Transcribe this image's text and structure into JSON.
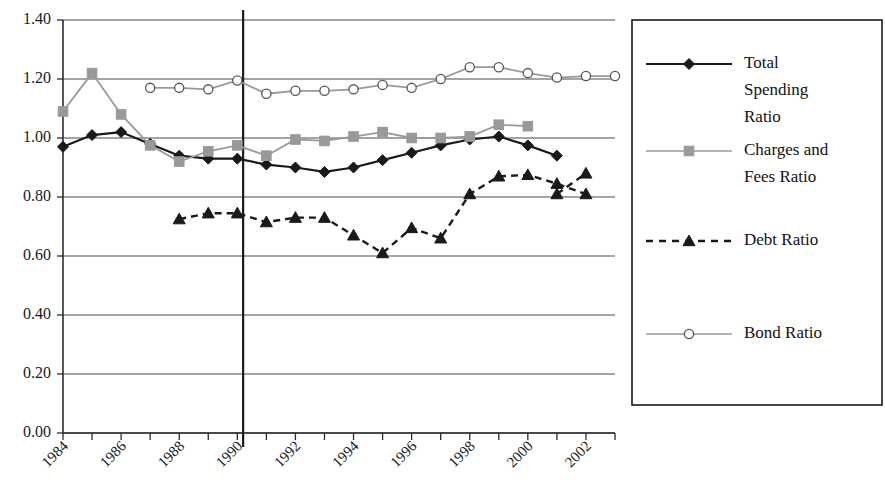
{
  "chart_data": {
    "type": "line",
    "title": "",
    "subtitle": "",
    "xlabel": "",
    "ylabel": "",
    "xlim": [
      1984,
      2003
    ],
    "ylim": [
      0.0,
      1.4
    ],
    "yticks": [
      "0.00",
      "0.20",
      "0.40",
      "0.60",
      "0.80",
      "1.00",
      "1.20",
      "1.40"
    ],
    "ytick_values": [
      0.0,
      0.2,
      0.4,
      0.6,
      0.8,
      1.0,
      1.2,
      1.4
    ],
    "xticks": [
      "1984",
      "1986",
      "1988",
      "1990",
      "1992",
      "1994",
      "1996",
      "1998",
      "2000",
      "2002"
    ],
    "xtick_values": [
      1984,
      1986,
      1988,
      1990,
      1992,
      1994,
      1996,
      1998,
      2000,
      2002
    ],
    "xtick_rotation": 45,
    "xtick_minor_values": [
      1985,
      1987,
      1989,
      1991,
      1993,
      1995,
      1997,
      1999,
      2001,
      2003
    ],
    "grid": "horizontal",
    "legend_position": "right",
    "annotations": [
      {
        "name": "vertical-reference-line",
        "type": "vline",
        "x": 1990.2,
        "color": "#1a1a1a"
      }
    ],
    "series": [
      {
        "name": "Total Spending Ratio",
        "color": "#1a1a1a",
        "line_style": "solid",
        "marker": "diamond-filled",
        "x": [
          1984,
          1985,
          1986,
          1987,
          1988,
          1989,
          1990,
          1991,
          1992,
          1993,
          1994,
          1995,
          1996,
          1997,
          1998,
          1999,
          2000,
          2001
        ],
        "values": [
          0.97,
          1.01,
          1.02,
          0.98,
          0.94,
          0.93,
          0.93,
          0.91,
          0.9,
          0.885,
          0.9,
          0.925,
          0.95,
          0.975,
          0.995,
          1.005,
          0.975,
          0.94
        ]
      },
      {
        "name": "Charges and Fees Ratio",
        "color": "#999999",
        "line_style": "solid",
        "marker": "square-filled",
        "x": [
          1984,
          1985,
          1986,
          1987,
          1988,
          1989,
          1990,
          1991,
          1992,
          1993,
          1994,
          1995,
          1996,
          1997,
          1998,
          1999,
          2000
        ],
        "values": [
          1.09,
          1.22,
          1.08,
          0.975,
          0.92,
          0.955,
          0.975,
          0.94,
          0.995,
          0.99,
          1.005,
          1.02,
          1.0,
          1.0,
          1.005,
          1.045,
          1.04
        ]
      },
      {
        "name": "Debt Ratio",
        "color": "#1a1a1a",
        "line_style": "dashed",
        "marker": "triangle-filled",
        "x": [
          1988,
          1989,
          1990,
          1991,
          1992,
          1993,
          1994,
          1995,
          1996,
          1997,
          1998,
          1999,
          2000,
          2001,
          2002
        ],
        "values": [
          0.725,
          0.745,
          0.745,
          0.715,
          0.73,
          0.73,
          0.67,
          0.61,
          0.695,
          0.66,
          0.81,
          0.87,
          0.875,
          0.845,
          0.81
        ]
      },
      {
        "name": "Debt Ratio Tail",
        "color": "#1a1a1a",
        "line_style": "dashed",
        "marker": "triangle-filled",
        "x": [
          2001,
          2002
        ],
        "values": [
          0.81,
          0.88
        ],
        "hidden_from_legend": true
      },
      {
        "name": "Bond Ratio",
        "color": "#999999",
        "line_style": "solid",
        "marker": "circle-open",
        "x": [
          1987,
          1988,
          1989,
          1990,
          1991,
          1992,
          1993,
          1994,
          1995,
          1996,
          1997,
          1998,
          1999,
          2000,
          2001,
          2002,
          2003
        ],
        "values": [
          1.17,
          1.17,
          1.165,
          1.195,
          1.15,
          1.16,
          1.16,
          1.165,
          1.18,
          1.17,
          1.2,
          1.24,
          1.24,
          1.22,
          1.205,
          1.21,
          1.21
        ]
      }
    ]
  },
  "legend": {
    "entries": [
      {
        "label_lines": [
          "Total",
          "Spending",
          "Ratio"
        ],
        "label": "Total Spending Ratio",
        "color": "#1a1a1a",
        "line_style": "solid",
        "marker": "diamond-filled"
      },
      {
        "label_lines": [
          "Charges and",
          "Fees Ratio"
        ],
        "label": "Charges and Fees Ratio",
        "color": "#999999",
        "line_style": "solid",
        "marker": "square-filled"
      },
      {
        "label_lines": [
          "Debt Ratio"
        ],
        "label": "Debt Ratio",
        "color": "#1a1a1a",
        "line_style": "dashed",
        "marker": "triangle-filled"
      },
      {
        "label_lines": [
          "Bond Ratio"
        ],
        "label": "Bond Ratio",
        "color": "#999999",
        "line_style": "solid",
        "marker": "circle-open"
      }
    ]
  },
  "geometry": {
    "plot_left": 63,
    "plot_right": 615,
    "plot_top": 20,
    "plot_bottom": 433,
    "legend_left": 632,
    "legend_top": 20,
    "legend_width": 250,
    "legend_height": 385
  },
  "colors": {
    "axis": "#2b2b2b",
    "grid": "#4a4a4a",
    "series_dark": "#1a1a1a",
    "series_gray": "#999999",
    "background": "#ffffff"
  }
}
